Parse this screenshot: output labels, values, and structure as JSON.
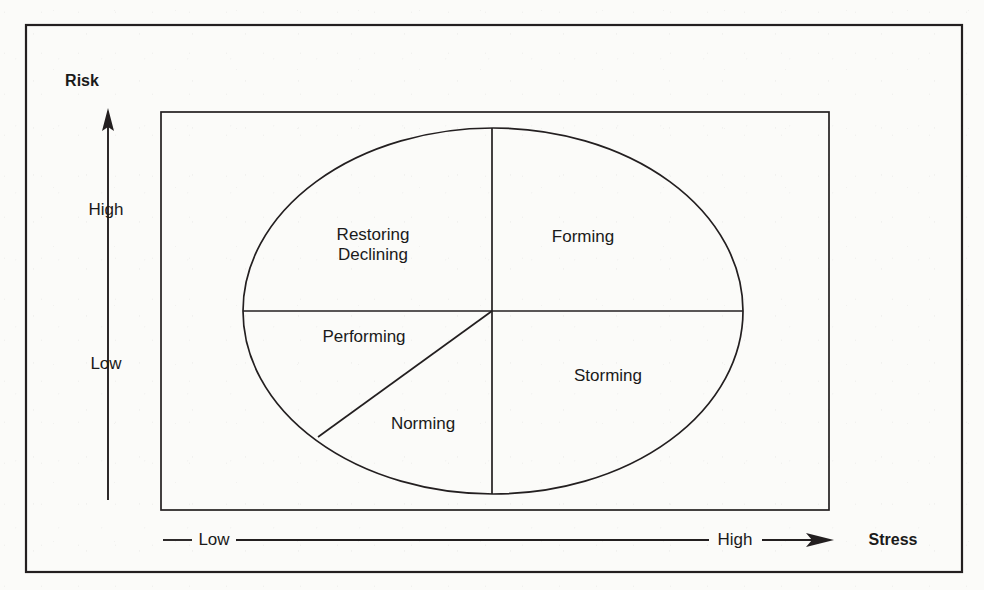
{
  "diagram": {
    "type": "quadrant-ellipse",
    "axes": {
      "vertical": {
        "title": "Risk",
        "arrow_direction": "up",
        "ticks": [
          {
            "label": "High",
            "position": "upper"
          },
          {
            "label": "Low",
            "position": "lower"
          }
        ]
      },
      "horizontal": {
        "title": "Stress",
        "arrow_direction": "right",
        "ticks": [
          {
            "label": "Low",
            "position": "left"
          },
          {
            "label": "High",
            "position": "right"
          }
        ]
      }
    },
    "segments": [
      {
        "id": "restoring-declining",
        "label_line1": "Restoring",
        "label_line2": "Declining",
        "quadrant": "upper-left"
      },
      {
        "id": "forming",
        "label_line1": "Forming",
        "label_line2": "",
        "quadrant": "upper-right"
      },
      {
        "id": "performing",
        "label_line1": "Performing",
        "label_line2": "",
        "quadrant": "lower-left-upper"
      },
      {
        "id": "norming",
        "label_line1": "Norming",
        "label_line2": "",
        "quadrant": "lower-left-lower"
      },
      {
        "id": "storming",
        "label_line1": "Storming",
        "label_line2": "",
        "quadrant": "lower-right"
      }
    ],
    "colors": {
      "stroke": "#231f20",
      "background": "#fbfbf9",
      "text": "#1a1a1a"
    }
  }
}
